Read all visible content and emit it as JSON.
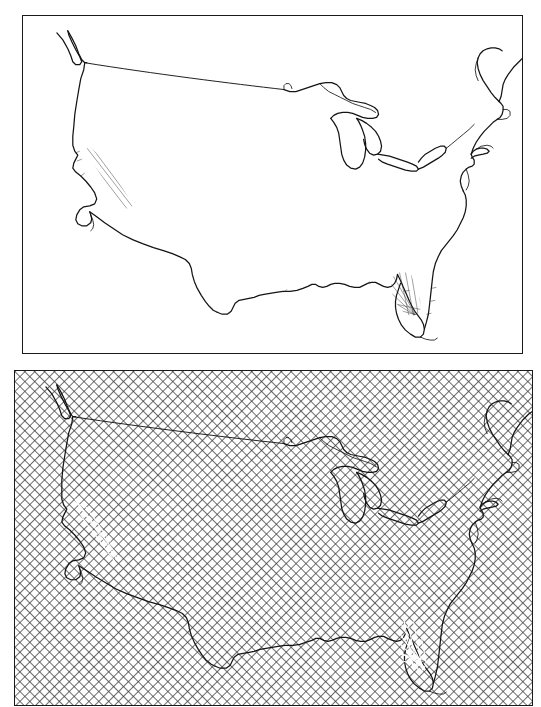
{
  "figure": {
    "title": "",
    "caption": "",
    "background_color": "#ffffff",
    "panel_count": 2,
    "outline_color": "#141414",
    "hatch_color": "#3a3a3a",
    "fill_color": "#ffffff"
  },
  "panels": [
    {
      "id": "panel-top",
      "name": "outline-map-panel",
      "label": "",
      "subject": "contiguous-united-states",
      "fill": "none",
      "border_color": "#1a1a1a",
      "x": 22,
      "y": 15,
      "width": 501,
      "height": 339,
      "features": [
        "national-boundary",
        "pacific-coastline",
        "atlantic-coastline",
        "gulf-coastline",
        "great-lakes",
        "canada-border",
        "florida-peninsula",
        "baja-california",
        "cape-cod",
        "chesapeake-bay",
        "long-island"
      ]
    },
    {
      "id": "panel-bottom",
      "name": "crosshatched-map-panel",
      "label": "",
      "subject": "contiguous-united-states",
      "fill": "crosshatch",
      "hatch_spacing_px": 7,
      "hatch_angle_deg": 45,
      "border_color": "#1a1a1a",
      "x": 14,
      "y": 370,
      "width": 519,
      "height": 336,
      "features": [
        "national-boundary",
        "pacific-coastline",
        "atlantic-coastline",
        "gulf-coastline",
        "great-lakes",
        "canada-border",
        "florida-peninsula",
        "baja-california",
        "cape-cod",
        "chesapeake-bay",
        "long-island"
      ]
    }
  ],
  "map_geometry": {
    "projection": "conic",
    "viewbox": "0 0 501 339",
    "coastline_path": "M 30 18 L 37 25 L 44 36 L 50 44 L 53 52 L 57 56 L 62 56 L 64 53 L 62 47 L 57 39 L 54 31 L 52 23 L 52 18 L 56 21 L 60 28 L 63 37 L 66 45 L 69 50 L 72 51 L 70 45 L 66 36 L 63 27 L 61 20 L 62 17 L 67 24 L 70 33 L 73 41 L 75 48 L 74 53 L 70 54 L 65 53 L 62 54 L 62 58 L 60 64 L 57 73 L 55 84 L 53 96 L 51 110 L 50 122 L 50 134 L 51 142 L 53 146 L 52 150 L 50 153 L 49 157 L 52 160 L 56 163 L 61 167 L 65 172 L 68 177 L 69 182 L 67 186 L 62 188 L 57 190 L 54 195 L 52 201 L 53 205 L 57 207 L 61 208 L 64 206 L 66 203 L 65 199 L 64 196",
    "gulf_path": "M 64 196 L 66 201 L 69 205 L 73 208 L 76 212 L 79 217 L 82 223 L 85 229 L 88 234 L 92 238 L 97 241 L 103 243 L 110 245 L 118 247 L 127 249 L 136 251 L 143 253 L 148 256 L 152 260 L 155 265 L 157 270 L 159 272",
    "florida_path": "M 379 215 L 382 223 L 385 232 L 388 241 L 391 250 L 394 259 L 396 268 L 398 277 L 399 285 L 400 292 L 399 298 L 396 302 L 392 303 L 389 300 L 387 295 L 386 289",
    "great_lakes_path": "M 300 64 L 312 58 L 323 57 L 333 60 L 340 66 L 345 72 L 348 78 L 349 84 L 347 90",
    "canada_border_path": "M 55 50 L 100 55 L 150 60 L 200 65 L 250 70 L 262 74"
  },
  "annotations": {
    "top_panel_note": "",
    "bottom_panel_note": "",
    "scale_bar": "",
    "north_arrow": ""
  }
}
